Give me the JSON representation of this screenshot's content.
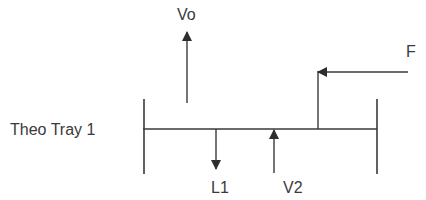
{
  "diagram": {
    "tray_label": "Theo Tray 1",
    "streams": [
      {
        "id": "Vo",
        "label": "Vo",
        "direction": "up",
        "description": "vapor leaving tray"
      },
      {
        "id": "F",
        "label": "F",
        "direction": "left",
        "description": "feed entering tray"
      },
      {
        "id": "L1",
        "label": "L1",
        "direction": "down",
        "description": "liquid leaving tray"
      },
      {
        "id": "V2",
        "label": "V2",
        "direction": "up",
        "description": "vapor entering tray"
      }
    ],
    "colors": {
      "line": "#3a3a3a",
      "text": "#3a3a3a",
      "background": "#ffffff"
    }
  }
}
